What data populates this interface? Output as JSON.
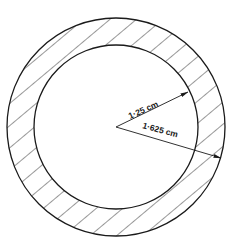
{
  "diagram": {
    "type": "annulus-cross-section",
    "center": {
      "x": 116,
      "y": 127
    },
    "outer_circle": {
      "radius_px": 109,
      "label": "1·625 cm"
    },
    "inner_circle": {
      "radius_px": 82,
      "label": "1·25 cm"
    },
    "hatch": {
      "region": "annulus",
      "direction": "top-left to bottom-right",
      "spacing_px": 17
    },
    "colors": {
      "stroke": "#1a1a1a",
      "background": "#ffffff"
    }
  },
  "labels": {
    "inner_radius": "1·25 cm",
    "outer_radius": "1·625 cm"
  }
}
